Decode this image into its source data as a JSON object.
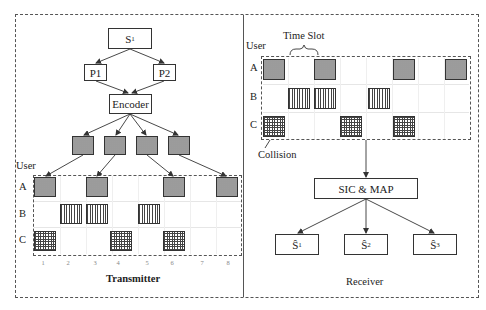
{
  "transmitter": {
    "title": "Transmitter",
    "source": {
      "label": "S",
      "sub": "1"
    },
    "paths": [
      {
        "label": "P1"
      },
      {
        "label": "P2"
      }
    ],
    "encoder": {
      "label": "Encoder"
    },
    "encoded_packets": 4,
    "user_axis_label": "User",
    "users": [
      "A",
      "B",
      "C"
    ],
    "slots": [
      "1",
      "2",
      "3",
      "4",
      "5",
      "6",
      "7",
      "8"
    ],
    "allocation": {
      "A": {
        "pattern": "dotted",
        "slots": [
          1,
          3,
          6,
          8
        ]
      },
      "B": {
        "pattern": "vertical-lines",
        "slots": [
          2,
          3,
          5
        ]
      },
      "C": {
        "pattern": "grid",
        "slots": [
          1,
          4,
          6
        ]
      }
    }
  },
  "receiver": {
    "title": "Receiver",
    "time_slot_label": "Time Slot",
    "user_axis_label": "User",
    "users": [
      "A",
      "B",
      "C"
    ],
    "collision_label": "Collision",
    "decoder": {
      "label": "SIC & MAP"
    },
    "outputs": [
      {
        "label": "Ŝ",
        "sub": "1"
      },
      {
        "label": "Ŝ",
        "sub": "2"
      },
      {
        "label": "Ŝ",
        "sub": "3"
      }
    ]
  },
  "colors": {
    "line": "#333333",
    "dashed_border": "#555555",
    "packet_fill_gray": "#bbbbbb",
    "background": "#ffffff"
  }
}
